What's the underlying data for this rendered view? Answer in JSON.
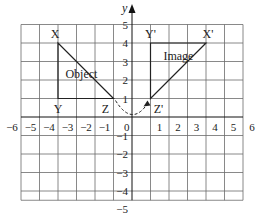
{
  "diagram": {
    "type": "coordinate-grid-rotation",
    "axes": {
      "x_label": "",
      "y_label": "y",
      "x_min": -6,
      "x_max": 6,
      "y_min": -5,
      "y_max": 5,
      "x_ticks": [
        -6,
        -5,
        -4,
        -3,
        -2,
        -1,
        0,
        1,
        2,
        3,
        4,
        5,
        6
      ],
      "y_ticks": [
        5,
        4,
        3,
        2,
        1,
        -1,
        -2,
        -3,
        -4,
        -5
      ]
    },
    "colors": {
      "grid": "#6b6b6b",
      "axis": "#111111",
      "shape": "#222222",
      "background": "#ffffff"
    },
    "object": {
      "label": "Object",
      "vertices": [
        {
          "name": "X",
          "x": -4,
          "y": 4
        },
        {
          "name": "Y",
          "x": -4,
          "y": 1
        },
        {
          "name": "Z",
          "x": -1,
          "y": 1
        }
      ]
    },
    "image": {
      "label": "Image",
      "vertices": [
        {
          "name": "X'",
          "x": 4,
          "y": 4
        },
        {
          "name": "Y'",
          "x": 1,
          "y": 4
        },
        {
          "name": "Z'",
          "x": 1,
          "y": 1
        }
      ]
    },
    "rotation_arrow": {
      "description": "dashed arc from Z to Z' about origin"
    }
  }
}
